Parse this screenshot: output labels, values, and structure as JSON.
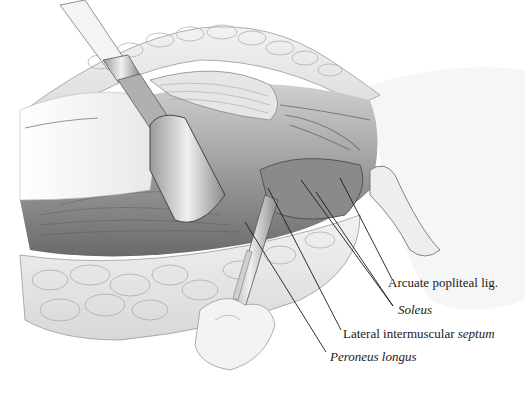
{
  "figure": {
    "labels": [
      {
        "id": "arcuate",
        "text": "Arcuate popliteal lig.",
        "italic": false,
        "x": 388,
        "y": 276
      },
      {
        "id": "soleus",
        "text": "Soleus",
        "italic": true,
        "x": 398,
        "y": 303
      },
      {
        "id": "septum",
        "text_plain": "Lateral intermuscular ",
        "text_italic": "septum",
        "x": 343,
        "y": 327
      },
      {
        "id": "peroneus",
        "text": "Peroneus longus",
        "italic": true,
        "x": 330,
        "y": 350
      }
    ],
    "colors": {
      "ink": "#1a1a1a",
      "background": "#ffffff",
      "tissue_light": "#e4e4e4",
      "tissue_mid": "#bdbdbd",
      "tissue_dark": "#5a5a5a"
    }
  }
}
